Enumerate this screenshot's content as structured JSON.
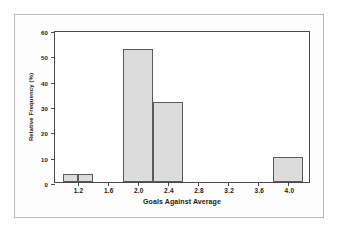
{
  "chart_data": {
    "type": "bar",
    "title": "",
    "subtitle": "",
    "xlabel": "Goals Against Average",
    "ylabel": "Relative Frequency (%)",
    "xlim": [
      0.9,
      4.3
    ],
    "ylim": [
      0,
      60
    ],
    "grid": false,
    "legend": null,
    "bin_width": 0.2,
    "xticks": [
      1.2,
      1.6,
      2.0,
      2.4,
      2.8,
      3.2,
      3.6,
      4.0
    ],
    "xtick_labels": [
      "1.2",
      "1.6",
      "2.0",
      "2.4",
      "2.8",
      "3.2",
      "3.6",
      "4.0"
    ],
    "yticks": [
      0,
      10,
      20,
      30,
      40,
      50,
      60
    ],
    "ytick_labels": [
      "0",
      "10",
      "20",
      "30",
      "40",
      "50",
      "60"
    ],
    "bars": [
      {
        "bin_start": 1.0,
        "bin_end": 1.2,
        "value": 3
      },
      {
        "bin_start": 1.2,
        "bin_end": 1.4,
        "value": 3
      },
      {
        "bin_start": 1.8,
        "bin_end": 2.2,
        "value": 52.5
      },
      {
        "bin_start": 2.2,
        "bin_end": 2.6,
        "value": 31.5
      },
      {
        "bin_start": 3.8,
        "bin_end": 4.2,
        "value": 10
      }
    ],
    "categories": [
      "1.0-1.2",
      "1.2-1.4",
      "1.8-2.2",
      "2.2-2.6",
      "3.8-4.2"
    ],
    "values": [
      3,
      3,
      52.5,
      31.5,
      10
    ],
    "colors": {
      "bar_fill": "#dcdcdc",
      "bar_edge": "#5a5a5a",
      "axis": "#4a4a4a",
      "outer_frame": "#b9b9b9",
      "text": "#1a1a1a",
      "background": "#ffffff"
    }
  }
}
